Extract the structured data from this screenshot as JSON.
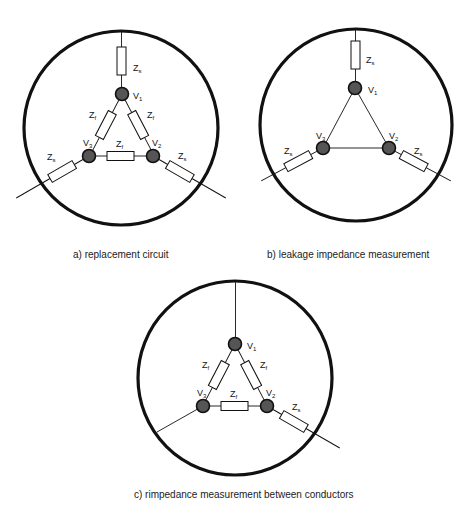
{
  "colors": {
    "stroke": "#111111",
    "node_fill": "#555555",
    "background": "#ffffff"
  },
  "panels": [
    {
      "id": "a",
      "caption": "a) replacement circuit",
      "circle": {
        "cx": 121,
        "cy": 128,
        "r": 97
      },
      "nodes": [
        {
          "label": "V",
          "sub": "1",
          "x": 122,
          "y": 94
        },
        {
          "label": "V",
          "sub": "2",
          "x": 153,
          "y": 156
        },
        {
          "label": "V",
          "sub": "3",
          "x": 89,
          "y": 156
        }
      ],
      "impedances": {
        "shunt": "Z",
        "shunt_sub": "s",
        "fault": "Z",
        "fault_sub": "f"
      }
    },
    {
      "id": "b",
      "caption": "b) leakage impedance measurement",
      "circle": {
        "cx": 356,
        "cy": 125,
        "r": 96
      },
      "nodes": [
        {
          "label": "V",
          "sub": "1",
          "x": 355,
          "y": 88
        },
        {
          "label": "V",
          "sub": "2",
          "x": 389,
          "y": 148
        },
        {
          "label": "V",
          "sub": "3",
          "x": 323,
          "y": 148
        }
      ],
      "impedances": {
        "shunt": "Z",
        "shunt_sub": "s"
      }
    },
    {
      "id": "c",
      "caption": "c) rimpedance measurement between conductors",
      "circle": {
        "cx": 235,
        "cy": 378,
        "r": 97
      },
      "nodes": [
        {
          "label": "V",
          "sub": "1",
          "x": 235,
          "y": 344
        },
        {
          "label": "V",
          "sub": "2",
          "x": 267,
          "y": 406
        },
        {
          "label": "V",
          "sub": "3",
          "x": 203,
          "y": 406
        }
      ],
      "impedances": {
        "shunt": "Z",
        "shunt_sub": "s",
        "fault": "Z",
        "fault_sub": "f"
      }
    }
  ]
}
